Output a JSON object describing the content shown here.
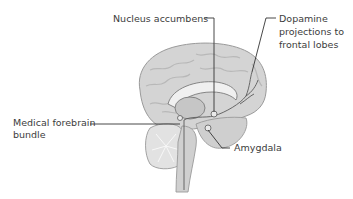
{
  "diagram": {
    "labels": {
      "nucleus_accumbens": "Nucleus accumbens",
      "dopamine_line1": "Dopamine",
      "dopamine_line2": "projections to",
      "dopamine_line3": "frontal lobes",
      "mfb_line1": "Medical forebrain",
      "mfb_line2": "bundle",
      "amygdala": "Amygdala"
    },
    "colors": {
      "background": "#ffffff",
      "brain_fill": "#d4d4d4",
      "brain_stroke": "#9a9a9a",
      "gyri": "#bdbdbd",
      "cerebellum": "#e2e2e2",
      "leader_lines": "#333333",
      "pathway": "#5a5a5a"
    }
  }
}
